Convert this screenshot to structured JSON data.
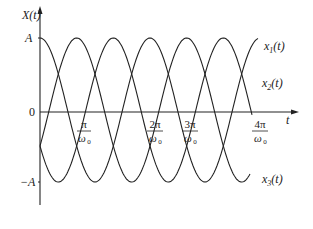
{
  "chart_data": {
    "type": "line",
    "title": "",
    "ylabel": "X(t)",
    "xlabel": "t",
    "y_ticks": [
      "A",
      "0",
      "-A"
    ],
    "x_ticks": [
      "π/ω₀",
      "2π/ω₀",
      "3π/ω₀",
      "4π/ω₀"
    ],
    "x_tick_values": [
      1,
      2,
      3,
      4
    ],
    "x_unit": "π/ω₀",
    "ylim": [
      -1,
      1
    ],
    "xlim": [
      0,
      4.5
    ],
    "series": [
      {
        "name": "x₁(t)",
        "label_main": "x",
        "label_sub": "1",
        "phase_deg": 0,
        "formula": "A cos(ω₀t)"
      },
      {
        "name": "x₂(t)",
        "label_main": "x",
        "label_sub": "2",
        "phase_deg": -120,
        "formula": "A cos(ω₀t − 2π/3)"
      },
      {
        "name": "x₃(t)",
        "label_main": "x",
        "label_sub": "3",
        "phase_deg": 120,
        "formula": "A cos(ω₀t + 2π/3)"
      }
    ],
    "grid": false,
    "legend_position": "inline-right"
  },
  "axes": {
    "y_label": "X(t)",
    "x_label": "t",
    "tick_A": "A",
    "tick_zero": "0",
    "tick_negA": "−A",
    "tick_1_num": "π",
    "tick_2_num": "2π",
    "tick_3_num": "3π",
    "tick_4_num": "4π",
    "tick_den": "ω",
    "tick_den_sub": "0"
  },
  "labels": {
    "x1": "x",
    "x1_sub": "1",
    "x2": "x",
    "x2_sub": "2",
    "x3": "x",
    "x3_sub": "3",
    "arg": "(t)"
  }
}
